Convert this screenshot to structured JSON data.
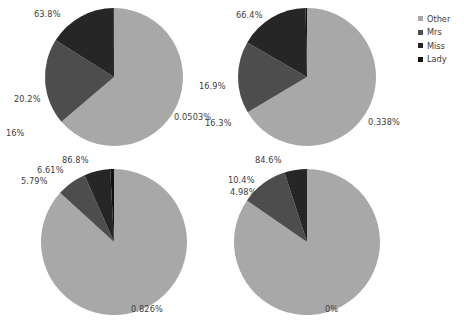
{
  "background_color": "#ffffff",
  "legend": {
    "name": "pie-legend",
    "position": "right",
    "items": [
      {
        "label": "Other",
        "color": "#a8a8a8"
      },
      {
        "label": "Mrs",
        "color": "#4d4d4d"
      },
      {
        "label": "Miss",
        "color": "#262626"
      },
      {
        "label": "Lady",
        "color": "#111111"
      }
    ]
  },
  "chart_data": {
    "type": "pie",
    "title": "",
    "subtitle": "",
    "xlabel": "",
    "ylabel": "",
    "grid": false,
    "legend_position": "right",
    "legend_entries": [
      "Other",
      "Mrs",
      "Miss",
      "Lady"
    ],
    "colors": [
      "#a8a8a8",
      "#4d4d4d",
      "#262626",
      "#111111"
    ],
    "start_angle_deg": 90,
    "direction": "clockwise",
    "units": "percent",
    "charts": [
      {
        "id": "pie-top-left",
        "position": "top-left",
        "categories": [
          "Other",
          "Mrs",
          "Miss",
          "Lady"
        ],
        "values": [
          63.8,
          20.2,
          16.0,
          0.0503
        ],
        "labels": [
          "63.8%",
          "20.2%",
          "16%",
          "0.0503%"
        ]
      },
      {
        "id": "pie-top-right",
        "position": "top-right",
        "categories": [
          "Other",
          "Mrs",
          "Miss",
          "Lady"
        ],
        "values": [
          66.4,
          16.9,
          16.3,
          0.338
        ],
        "labels": [
          "66.4%",
          "16.9%",
          "16.3%",
          "0.338%"
        ]
      },
      {
        "id": "pie-bottom-left",
        "position": "bottom-left",
        "categories": [
          "Other",
          "Mrs",
          "Miss",
          "Lady"
        ],
        "values": [
          86.8,
          6.61,
          5.79,
          0.826
        ],
        "labels": [
          "86.8%",
          "6.61%",
          "5.79%",
          "0.826%"
        ]
      },
      {
        "id": "pie-bottom-right",
        "position": "bottom-right",
        "categories": [
          "Other",
          "Mrs",
          "Miss",
          "Lady"
        ],
        "values": [
          84.6,
          10.4,
          4.98,
          0.0
        ],
        "labels": [
          "84.6%",
          "10.4%",
          "4.98%",
          "0%"
        ]
      }
    ]
  },
  "geometry": {
    "pies": [
      {
        "id": "pie-top-left",
        "cx": 114,
        "cy": 77,
        "r": 69
      },
      {
        "id": "pie-top-right",
        "cx": 307,
        "cy": 77,
        "r": 69
      },
      {
        "id": "pie-bottom-left",
        "cx": 114,
        "cy": 242,
        "r": 73
      },
      {
        "id": "pie-bottom-right",
        "cx": 307,
        "cy": 242,
        "r": 73
      }
    ],
    "label_positions": {
      "pie-top-left": [
        {
          "x": 34,
          "y": 10
        },
        {
          "x": 14,
          "y": 95
        },
        {
          "x": 6,
          "y": 129
        },
        {
          "x": 174,
          "y": 113
        }
      ],
      "pie-top-right": [
        {
          "x": 236,
          "y": 11
        },
        {
          "x": 199,
          "y": 82
        },
        {
          "x": 205,
          "y": 119
        },
        {
          "x": 368,
          "y": 118
        }
      ],
      "pie-bottom-left": [
        {
          "x": 62,
          "y": 156
        },
        {
          "x": 37,
          "y": 166
        },
        {
          "x": 21,
          "y": 177
        },
        {
          "x": 131,
          "y": 305
        }
      ],
      "pie-bottom-right": [
        {
          "x": 255,
          "y": 156
        },
        {
          "x": 228,
          "y": 176
        },
        {
          "x": 230,
          "y": 188
        },
        {
          "x": 325,
          "y": 305
        }
      ]
    }
  }
}
